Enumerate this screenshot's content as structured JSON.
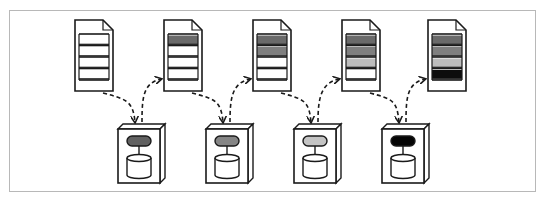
{
  "diagram": {
    "frame_color": "#b8b8b8",
    "stroke_color": "#1a1a1a",
    "documents": [
      {
        "id": "doc-1",
        "x": 75,
        "y": 20,
        "rows": [
          null,
          null,
          null,
          null
        ]
      },
      {
        "id": "doc-2",
        "x": 164,
        "y": 20,
        "rows": [
          "#6a6a6a",
          null,
          null,
          null
        ]
      },
      {
        "id": "doc-3",
        "x": 253,
        "y": 20,
        "rows": [
          "#6a6a6a",
          "#7f7f7f",
          null,
          null
        ]
      },
      {
        "id": "doc-4",
        "x": 342,
        "y": 20,
        "rows": [
          "#6a6a6a",
          "#7f7f7f",
          "#bdbdbd",
          null
        ]
      },
      {
        "id": "doc-5",
        "x": 428,
        "y": 20,
        "rows": [
          "#6a6a6a",
          "#7f7f7f",
          "#bdbdbd",
          "#0d0d0d"
        ]
      }
    ],
    "servers": [
      {
        "id": "server-1",
        "x": 118,
        "y": 129,
        "pill_color": "#616161"
      },
      {
        "id": "server-2",
        "x": 206,
        "y": 129,
        "pill_color": "#858585"
      },
      {
        "id": "server-3",
        "x": 294,
        "y": 129,
        "pill_color": "#c4c4c4"
      },
      {
        "id": "server-4",
        "x": 382,
        "y": 129,
        "pill_color": "#050505"
      }
    ],
    "arrows_down": [
      {
        "from": "doc-1",
        "to": "server-1"
      },
      {
        "from": "doc-2",
        "to": "server-2"
      },
      {
        "from": "doc-3",
        "to": "server-3"
      },
      {
        "from": "doc-4",
        "to": "server-4"
      }
    ],
    "arrows_up": [
      {
        "from": "server-1",
        "to": "doc-2"
      },
      {
        "from": "server-2",
        "to": "doc-3"
      },
      {
        "from": "server-3",
        "to": "doc-4"
      },
      {
        "from": "server-4",
        "to": "doc-5"
      }
    ]
  }
}
